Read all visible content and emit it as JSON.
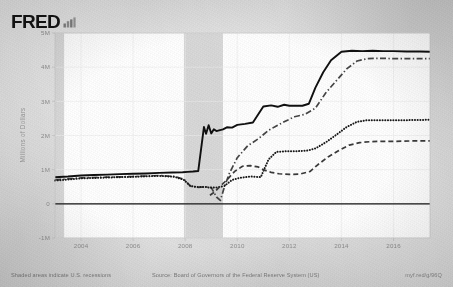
{
  "brand": {
    "name": "FRED",
    "mark_icon": "bar-chart-icon"
  },
  "footer": {
    "recessions_note": "Shaded areas indicate U.S. recessions",
    "source": "Source: Board of Governors of the Federal Reserve System (US)",
    "permalink": "myf.red/g/96Q"
  },
  "chart_data": {
    "type": "line",
    "title": "",
    "xlabel": "",
    "ylabel": "Millions of Dollars",
    "xlim": [
      2003.0,
      2017.4
    ],
    "ylim": [
      -1000000,
      5000000
    ],
    "ytick_labels": [
      "5M",
      "4M",
      "3M",
      "2M",
      "1M",
      "0",
      "-1M"
    ],
    "ytick_values": [
      5000000,
      4000000,
      3000000,
      2000000,
      1000000,
      0,
      -1000000
    ],
    "xtick_labels": [
      "2004",
      "2006",
      "2008",
      "2010",
      "2012",
      "2014",
      "2016"
    ],
    "xtick_values": [
      2004,
      2006,
      2008,
      2010,
      2012,
      2014,
      2016
    ],
    "grid": true,
    "legend_position": "none",
    "recession_bands": [
      {
        "start": 2003.0,
        "end": 2003.35
      },
      {
        "start": 2007.95,
        "end": 2009.45
      }
    ],
    "zero_line": 0,
    "series": [
      {
        "name": "Total Assets",
        "style": "solid",
        "color": "#101010",
        "x": [
          2003.0,
          2003.5,
          2004.0,
          2004.5,
          2005.0,
          2005.5,
          2006.0,
          2006.5,
          2007.0,
          2007.5,
          2007.9,
          2008.1,
          2008.3,
          2008.5,
          2008.72,
          2008.8,
          2008.9,
          2009.0,
          2009.1,
          2009.2,
          2009.3,
          2009.45,
          2009.6,
          2009.8,
          2010.0,
          2010.3,
          2010.6,
          2011.0,
          2011.3,
          2011.55,
          2011.8,
          2012.0,
          2012.25,
          2012.5,
          2012.75,
          2013.0,
          2013.3,
          2013.6,
          2014.0,
          2014.4,
          2014.8,
          2015.2,
          2015.6,
          2016.0,
          2016.5,
          2017.0,
          2017.4
        ],
        "y": [
          780000,
          800000,
          830000,
          845000,
          855000,
          870000,
          880000,
          890000,
          905000,
          915000,
          925000,
          935000,
          945000,
          960000,
          2250000,
          2050000,
          2300000,
          2060000,
          2180000,
          2130000,
          2150000,
          2180000,
          2240000,
          2230000,
          2310000,
          2340000,
          2380000,
          2850000,
          2880000,
          2840000,
          2900000,
          2870000,
          2870000,
          2870000,
          2930000,
          3400000,
          3850000,
          4200000,
          4450000,
          4480000,
          4470000,
          4480000,
          4470000,
          4470000,
          4460000,
          4460000,
          4450000
        ]
      },
      {
        "name": "Securities Held Outright",
        "style": "dashdot",
        "color": "#454545",
        "x": [
          2003.0,
          2004.0,
          2005.0,
          2006.0,
          2007.0,
          2007.6,
          2007.95,
          2008.2,
          2008.5,
          2008.75,
          2009.0,
          2009.2,
          2009.35,
          2009.5,
          2009.7,
          2010.0,
          2010.4,
          2010.8,
          2011.2,
          2011.5,
          2011.8,
          2012.2,
          2012.6,
          2013.0,
          2013.4,
          2013.8,
          2014.2,
          2014.6,
          2015.0,
          2015.5,
          2016.0,
          2016.6,
          2017.4
        ],
        "y": [
          700000,
          760000,
          780000,
          800000,
          830000,
          800000,
          720000,
          520000,
          480000,
          500000,
          480000,
          200000,
          100000,
          480000,
          900000,
          1350000,
          1700000,
          1900000,
          2150000,
          2280000,
          2400000,
          2550000,
          2620000,
          2800000,
          3250000,
          3600000,
          3950000,
          4180000,
          4250000,
          4260000,
          4250000,
          4250000,
          4250000
        ]
      },
      {
        "name": "U.S. Treasury Securities",
        "style": "dotted",
        "color": "#181818",
        "x": [
          2003.0,
          2004.0,
          2005.0,
          2006.0,
          2007.0,
          2007.6,
          2007.95,
          2008.2,
          2008.5,
          2008.8,
          2009.0,
          2009.2,
          2009.5,
          2009.8,
          2010.1,
          2010.5,
          2010.9,
          2011.2,
          2011.5,
          2011.9,
          2012.3,
          2012.7,
          2013.0,
          2013.4,
          2013.8,
          2014.2,
          2014.6,
          2015.0,
          2015.5,
          2016.0,
          2016.6,
          2017.4
        ],
        "y": [
          680000,
          745000,
          770000,
          790000,
          820000,
          790000,
          700000,
          520000,
          490000,
          490000,
          470000,
          480000,
          520000,
          700000,
          760000,
          800000,
          780000,
          1300000,
          1520000,
          1540000,
          1540000,
          1560000,
          1620000,
          1800000,
          2020000,
          2250000,
          2400000,
          2450000,
          2450000,
          2450000,
          2450000,
          2460000
        ]
      },
      {
        "name": "Mortgage-Backed Securities",
        "style": "dashed",
        "color": "#3a3a3a",
        "x": [
          2008.95,
          2009.1,
          2009.3,
          2009.6,
          2009.9,
          2010.2,
          2010.5,
          2010.8,
          2011.0,
          2011.3,
          2011.6,
          2012.0,
          2012.4,
          2012.8,
          2013.1,
          2013.5,
          2013.9,
          2014.3,
          2014.7,
          2015.1,
          2015.6,
          2016.1,
          2016.7,
          2017.4
        ],
        "y": [
          250000,
          330000,
          480000,
          700000,
          950000,
          1100000,
          1120000,
          1080000,
          1000000,
          920000,
          880000,
          860000,
          870000,
          950000,
          1150000,
          1380000,
          1560000,
          1720000,
          1790000,
          1820000,
          1830000,
          1830000,
          1840000,
          1840000
        ]
      }
    ]
  }
}
